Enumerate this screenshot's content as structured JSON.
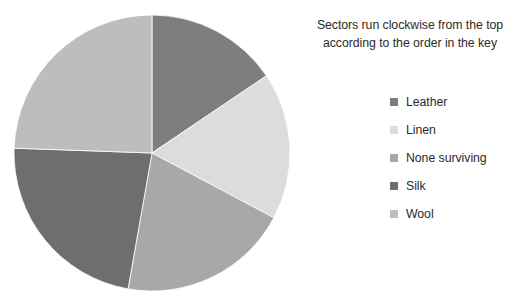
{
  "legend": {
    "note_line_1": "Sectors run clockwise from the top",
    "note_line_2": "according to the order in the key"
  },
  "chart_data": {
    "type": "pie",
    "title": "",
    "subtitle": "Sectors run clockwise from the top according to the order in the key",
    "legend_position": "right",
    "start_angle_deg": 0,
    "direction": "clockwise",
    "labels": [
      "Leather",
      "Linen",
      "None surviving",
      "Silk",
      "Wool"
    ],
    "values": [
      15.6,
      17.2,
      20.0,
      22.8,
      24.4
    ],
    "value_unit": "percent",
    "colors": [
      "#7e7e7e",
      "#dcdcdc",
      "#a8a8a8",
      "#6e6e6e",
      "#bdbdbd"
    ],
    "slices": [
      {
        "label": "Leather",
        "value": 15.6,
        "start_deg": 0,
        "end_deg": 56,
        "color": "#7e7e7e"
      },
      {
        "label": "Linen",
        "value": 17.2,
        "start_deg": 56,
        "end_deg": 118,
        "color": "#dcdcdc"
      },
      {
        "label": "None surviving",
        "value": 20.0,
        "start_deg": 118,
        "end_deg": 190,
        "color": "#a8a8a8"
      },
      {
        "label": "Silk",
        "value": 22.8,
        "start_deg": 190,
        "end_deg": 272,
        "color": "#6e6e6e"
      },
      {
        "label": "Wool",
        "value": 24.4,
        "start_deg": 272,
        "end_deg": 360,
        "color": "#bdbdbd"
      }
    ],
    "geometry": {
      "center_x": 152,
      "center_y": 153,
      "radius": 138
    }
  }
}
